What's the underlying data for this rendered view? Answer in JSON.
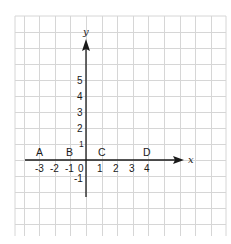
{
  "diagram": {
    "type": "coordinate-plane",
    "axes": {
      "x_name": "x",
      "y_name": "y"
    },
    "x_tick_labels": [
      "-3",
      "-2",
      "-1",
      "0",
      "1",
      "2",
      "3",
      "4"
    ],
    "y_tick_labels": [
      "5",
      "4",
      "3",
      "2",
      "1",
      "-1"
    ],
    "points": [
      {
        "label": "A",
        "x": -3
      },
      {
        "label": "B",
        "x": -1
      },
      {
        "label": "C",
        "x": 1
      },
      {
        "label": "D",
        "x": 4
      }
    ],
    "colors": {
      "grid": "#d6d6d6",
      "axis": "#1a1a1a",
      "background": "#ffffff"
    }
  }
}
